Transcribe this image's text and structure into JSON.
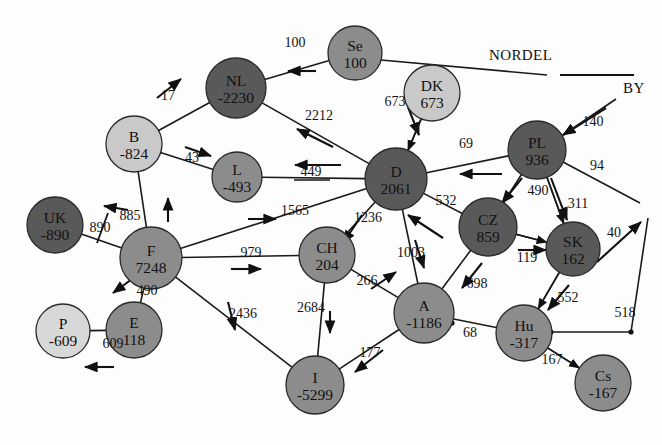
{
  "diagram": {
    "type": "node-link-graph",
    "colors": {
      "node_dark": "#595959",
      "node_mid": "#8c8c8c",
      "node_light": "#c9c9c9",
      "node_very_light": "#d8d8d8",
      "stroke": "#2a2a2a",
      "label": "#111111",
      "background": "#fdfdfd"
    },
    "region_labels": [
      {
        "name": "nordel-label",
        "text": "NORDEL",
        "x": 489,
        "y": 60
      },
      {
        "name": "by-label",
        "text": "BY",
        "x": 623,
        "y": 93
      }
    ],
    "nodes": [
      {
        "id": "Se",
        "label": "Se",
        "value": "100",
        "x": 355,
        "y": 53,
        "r": 27,
        "shade": "node_mid"
      },
      {
        "id": "NL",
        "label": "NL",
        "value": "-2230",
        "x": 236,
        "y": 88,
        "r": 30,
        "shade": "node_dark"
      },
      {
        "id": "DK",
        "label": "DK",
        "value": "673",
        "x": 432,
        "y": 93,
        "r": 28,
        "shade": "node_light"
      },
      {
        "id": "B",
        "label": "B",
        "value": "-824",
        "x": 134,
        "y": 144,
        "r": 28,
        "shade": "node_light"
      },
      {
        "id": "PL",
        "label": "PL",
        "value": "936",
        "x": 537,
        "y": 150,
        "r": 29,
        "shade": "node_dark"
      },
      {
        "id": "L",
        "label": "L",
        "value": "-493",
        "x": 237,
        "y": 177,
        "r": 25,
        "shade": "node_mid"
      },
      {
        "id": "D",
        "label": "D",
        "value": "2061",
        "x": 396,
        "y": 179,
        "r": 31,
        "shade": "node_dark"
      },
      {
        "id": "UK",
        "label": "UK",
        "value": "-890",
        "x": 55,
        "y": 225,
        "r": 28,
        "shade": "node_dark"
      },
      {
        "id": "CZ",
        "label": "CZ",
        "value": "859",
        "x": 488,
        "y": 227,
        "r": 29,
        "shade": "node_dark"
      },
      {
        "id": "SK",
        "label": "SK",
        "value": "162",
        "x": 573,
        "y": 249,
        "r": 27,
        "shade": "node_dark"
      },
      {
        "id": "CH",
        "label": "CH",
        "value": "204",
        "x": 327,
        "y": 255,
        "r": 28,
        "shade": "node_mid"
      },
      {
        "id": "F",
        "label": "F",
        "value": "7248",
        "x": 151,
        "y": 258,
        "r": 31,
        "shade": "node_mid"
      },
      {
        "id": "A",
        "label": "A",
        "value": "-1186",
        "x": 424,
        "y": 313,
        "r": 30,
        "shade": "node_mid"
      },
      {
        "id": "E",
        "label": "E",
        "value": "118",
        "x": 134,
        "y": 330,
        "r": 28,
        "shade": "node_mid"
      },
      {
        "id": "Hu",
        "label": "Hu",
        "value": "-317",
        "x": 524,
        "y": 333,
        "r": 28,
        "shade": "node_mid"
      },
      {
        "id": "P",
        "label": "P",
        "value": "-609",
        "x": 63,
        "y": 331,
        "r": 27,
        "shade": "node_very_light"
      },
      {
        "id": "I",
        "label": "I",
        "value": "-5299",
        "x": 315,
        "y": 385,
        "r": 29,
        "shade": "node_mid"
      },
      {
        "id": "Cs",
        "label": "Cs",
        "value": "-167",
        "x": 603,
        "y": 383,
        "r": 28,
        "shade": "node_mid"
      }
    ],
    "edges": [
      {
        "name": "edge-se-nl",
        "from": "Se",
        "to": "NL",
        "value": "100",
        "lx": 295,
        "ly": 47,
        "ax1": 316,
        "ay1": 71,
        "ax2": 288,
        "ay2": 71
      },
      {
        "name": "edge-se-nordel",
        "from": "Se",
        "to": "nordel_tick",
        "value": "",
        "lx": 0,
        "ly": 0,
        "ax1": 0,
        "ay1": 0,
        "ax2": 0,
        "ay2": 0
      },
      {
        "name": "edge-nl-b",
        "from": "NL",
        "to": "B",
        "value": "17",
        "lx": 168,
        "ly": 100,
        "ax1": 157,
        "ay1": 98,
        "ax2": 181,
        "ay2": 79
      },
      {
        "name": "edge-nl-d",
        "from": "NL",
        "to": "D",
        "value": "2212",
        "lx": 319,
        "ly": 120,
        "ax1": 333,
        "ay1": 147,
        "ax2": 297,
        "ay2": 129
      },
      {
        "name": "edge-dk-d",
        "from": "DK",
        "to": "D",
        "value": "673",
        "lx": 395,
        "ly": 106,
        "ax1": 408,
        "ay1": 107,
        "ax2": 419,
        "ay2": 135
      },
      {
        "name": "edge-b-l",
        "from": "B",
        "to": "L",
        "value": "43",
        "lx": 192,
        "ly": 162,
        "ax1": 185,
        "ay1": 147,
        "ax2": 211,
        "ay2": 156
      },
      {
        "name": "edge-b-f",
        "from": "B",
        "to": "F",
        "value": "885",
        "lx": 130,
        "ly": 220,
        "ax1": 168,
        "ay1": 222,
        "ax2": 168,
        "ay2": 198
      },
      {
        "name": "edge-l-d",
        "from": "L",
        "to": "D",
        "value": "449",
        "lx": 311,
        "ly": 176,
        "ax1": 341,
        "ay1": 165,
        "ax2": 295,
        "ay2": 165
      },
      {
        "name": "edge-pl-by",
        "from": "PL",
        "to": "by_end",
        "value": "140",
        "lx": 593,
        "ly": 126,
        "ax1": 606,
        "ay1": 108,
        "ax2": 563,
        "ay2": 135
      },
      {
        "name": "edge-pl-d",
        "from": "PL",
        "to": "D",
        "value": "69",
        "lx": 466,
        "ly": 148,
        "ax1": 502,
        "ay1": 174,
        "ax2": 460,
        "ay2": 174
      },
      {
        "name": "edge-pl-east",
        "from": "PL",
        "to": "east_end",
        "value": "94",
        "lx": 597,
        "ly": 170,
        "ax1": 0,
        "ay1": 0,
        "ax2": 0,
        "ay2": 0
      },
      {
        "name": "edge-pl-cz",
        "from": "PL",
        "to": "CZ",
        "value": "490",
        "lx": 538,
        "ly": 195,
        "ax1": 522,
        "ay1": 178,
        "ax2": 502,
        "ay2": 203
      },
      {
        "name": "edge-pl-sk",
        "from": "PL",
        "to": "SK",
        "value": "311",
        "lx": 578,
        "ly": 208,
        "ax1": 551,
        "ay1": 178,
        "ax2": 567,
        "ay2": 220
      },
      {
        "name": "edge-uk-f",
        "from": "UK",
        "to": "F",
        "value": "890",
        "lx": 100,
        "ly": 232,
        "ax1": 128,
        "ay1": 210,
        "ax2": 104,
        "ay2": 206
      },
      {
        "name": "edge-d-f",
        "from": "D",
        "to": "F",
        "value": "1565",
        "lx": 295,
        "ly": 215,
        "ax1": 248,
        "ay1": 219,
        "ax2": 276,
        "ay2": 219
      },
      {
        "name": "edge-d-ch",
        "from": "D",
        "to": "CH",
        "value": "1236",
        "lx": 368,
        "ly": 222,
        "ax1": 362,
        "ay1": 215,
        "ax2": 343,
        "ay2": 243
      },
      {
        "name": "edge-d-a",
        "from": "D",
        "to": "A",
        "value": "1003",
        "lx": 411,
        "ly": 257,
        "ax1": 415,
        "ay1": 240,
        "ax2": 424,
        "ay2": 268
      },
      {
        "name": "edge-d-cz",
        "from": "D",
        "to": "CZ",
        "value": "532",
        "lx": 446,
        "ly": 205,
        "ax1": 443,
        "ay1": 238,
        "ax2": 408,
        "ay2": 215
      },
      {
        "name": "edge-cz-sk",
        "from": "CZ",
        "to": "SK",
        "value": "119",
        "lx": 527,
        "ly": 262,
        "ax1": 518,
        "ay1": 250,
        "ax2": 546,
        "ay2": 250
      },
      {
        "name": "edge-cz-a",
        "from": "CZ",
        "to": "A",
        "value": "698",
        "lx": 477,
        "ly": 288,
        "ax1": 482,
        "ay1": 263,
        "ax2": 462,
        "ay2": 288
      },
      {
        "name": "edge-sk-east",
        "from": "SK",
        "to": "east_corner",
        "value": "40",
        "lx": 614,
        "ly": 237,
        "ax1": 0,
        "ay1": 0,
        "ax2": 0,
        "ay2": 0
      },
      {
        "name": "edge-sk-hu",
        "from": "SK",
        "to": "Hu",
        "value": "552",
        "lx": 568,
        "ly": 302,
        "ax1": 569,
        "ay1": 285,
        "ax2": 548,
        "ay2": 310
      },
      {
        "name": "edge-f-ch",
        "from": "F",
        "to": "CH",
        "value": "979",
        "lx": 251,
        "ly": 257,
        "ax1": 231,
        "ay1": 269,
        "ax2": 261,
        "ay2": 269
      },
      {
        "name": "edge-f-e",
        "from": "F",
        "to": "E",
        "value": "490",
        "lx": 147,
        "ly": 295,
        "ax1": 132,
        "ay1": 279,
        "ax2": 113,
        "ay2": 293
      },
      {
        "name": "edge-f-i",
        "from": "F",
        "to": "I",
        "value": "2436",
        "lx": 243,
        "ly": 318,
        "ax1": 228,
        "ay1": 302,
        "ax2": 235,
        "ay2": 330
      },
      {
        "name": "edge-ch-a",
        "from": "CH",
        "to": "A",
        "value": "266",
        "lx": 367,
        "ly": 285,
        "ax1": 371,
        "ay1": 289,
        "ax2": 396,
        "ay2": 272
      },
      {
        "name": "edge-ch-i",
        "from": "CH",
        "to": "I",
        "value": "2684",
        "lx": 311,
        "ly": 312,
        "ax1": 330,
        "ay1": 311,
        "ax2": 330,
        "ay2": 333
      },
      {
        "name": "edge-a-hu",
        "from": "A",
        "to": "Hu",
        "value": "68",
        "lx": 470,
        "ly": 337,
        "ax1": 0,
        "ay1": 0,
        "ax2": 0,
        "ay2": 0
      },
      {
        "name": "edge-a-i",
        "from": "A",
        "to": "I",
        "value": "177",
        "lx": 370,
        "ly": 357,
        "ax1": 383,
        "ay1": 350,
        "ax2": 355,
        "ay2": 372
      },
      {
        "name": "edge-hu-east",
        "from": "Hu",
        "to": "east_corner",
        "value": "518",
        "lx": 625,
        "ly": 317,
        "ax1": 0,
        "ay1": 0,
        "ax2": 0,
        "ay2": 0
      },
      {
        "name": "edge-hu-cs",
        "from": "Hu",
        "to": "Cs",
        "value": "167",
        "lx": 552,
        "ly": 364,
        "ax1": 0,
        "ay1": 0,
        "ax2": 0,
        "ay2": 0
      },
      {
        "name": "edge-p-e",
        "from": "P",
        "to": "E",
        "value": "609",
        "lx": 113,
        "ly": 348,
        "ax1": 114,
        "ay1": 367,
        "ax2": 85,
        "ay2": 367
      }
    ]
  }
}
